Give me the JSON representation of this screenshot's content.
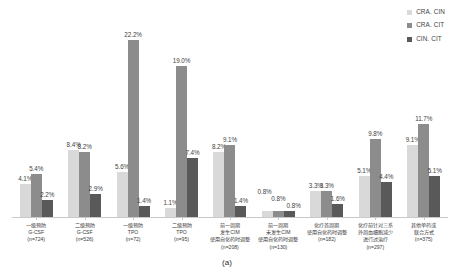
{
  "figure": {
    "caption": "(a)"
  },
  "legend": {
    "position": "top-right",
    "items": [
      {
        "label": "CRA. CIN",
        "color": "#d9d9d9",
        "icon": "legend-swatch-icon"
      },
      {
        "label": "CRA. CIT",
        "color": "#8c8c8c",
        "icon": "legend-swatch-icon"
      },
      {
        "label": "CIN. CIT",
        "color": "#595959",
        "icon": "legend-swatch-icon"
      }
    ]
  },
  "chart_data": {
    "type": "bar",
    "title": "",
    "subtitle": "",
    "xlabel": "",
    "ylabel": "",
    "ylim": [
      0,
      24
    ],
    "grid": false,
    "legend_position": "top-right",
    "value_suffix": "%",
    "categories": [
      "一级预防\nG-CSF\n(n=724)",
      "二级预防\nG-CSF\n(n=526)",
      "一级预防\nTPO\n(n=72)",
      "二级预防\nTPO\n(n=95)",
      "前一周期\n发生CIM\n使用自化药时调整\n(n=208)",
      "前一周期\n未发生CIM\n使用自化药时调整\n(n=130)",
      "化疗首周期\n使用自化药时调整\n(n=182)",
      "化疗前针对三系\n外周血细胞减少\n进行过治疗\n(n=297)",
      "其他单药或\n联合方式\n(n=375)"
    ],
    "category_labels": [
      {
        "lines": [
          "一级预防",
          "G-CSF"
        ],
        "n": "(n=724)"
      },
      {
        "lines": [
          "二级预防",
          "G-CSF"
        ],
        "n": "(n=526)"
      },
      {
        "lines": [
          "一级预防",
          "TPO"
        ],
        "n": "(n=72)"
      },
      {
        "lines": [
          "二级预防",
          "TPO"
        ],
        "n": "(n=95)"
      },
      {
        "lines": [
          "前一周期",
          "发生CIM",
          "使用自化药时调整"
        ],
        "n": "(n=208)"
      },
      {
        "lines": [
          "前一周期",
          "未发生CIM",
          "使用自化药时调整"
        ],
        "n": "(n=130)"
      },
      {
        "lines": [
          "化疗首周期",
          "使用自化药时调整"
        ],
        "n": "(n=182)"
      },
      {
        "lines": [
          "化疗前针对三系",
          "外周血细胞减少",
          "进行过治疗"
        ],
        "n": "(n=297)"
      },
      {
        "lines": [
          "其他单药或",
          "联合方式"
        ],
        "n": "(n=375)"
      }
    ],
    "series": [
      {
        "name": "CRA. CIN",
        "color": "#d9d9d9",
        "values": [
          4.1,
          8.4,
          5.6,
          1.1,
          8.2,
          0.8,
          3.3,
          5.1,
          9.1
        ],
        "labels": [
          "4.1%",
          "8.4%",
          "5.6%",
          "1.1%",
          "8.2%",
          "0.8%",
          "3.3%",
          "5.1%",
          "9.1%"
        ]
      },
      {
        "name": "CRA. CIT",
        "color": "#8c8c8c",
        "values": [
          5.4,
          8.2,
          22.2,
          19.0,
          9.1,
          0.8,
          3.3,
          9.8,
          11.7
        ],
        "labels": [
          "5.4%",
          "8.2%",
          "22.2%",
          "19.0%",
          "9.1%",
          "0.8%",
          "3.3%",
          "9.8%",
          "11.7%"
        ]
      },
      {
        "name": "CIN. CIT",
        "color": "#595959",
        "values": [
          2.2,
          2.9,
          1.4,
          7.4,
          1.4,
          0.8,
          1.6,
          4.4,
          5.1
        ],
        "labels": [
          "2.2%",
          "2.9%",
          "1.4%",
          "7.4%",
          "1.4%",
          "0.8%",
          "1.6%",
          "4.4%",
          "5.1%"
        ]
      }
    ]
  }
}
